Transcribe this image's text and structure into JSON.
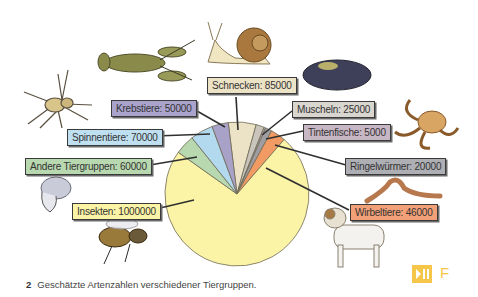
{
  "chart_data": {
    "type": "pie",
    "title": "",
    "center": [
      237,
      194
    ],
    "radius": 72,
    "start_angle_deg": -7,
    "slices": [
      {
        "name": "Schnecken",
        "value": 85000,
        "color": "#ece2c6"
      },
      {
        "name": "Muscheln",
        "value": 25000,
        "color": "#c9c4bc"
      },
      {
        "name": "Tintenfische",
        "value": 5000,
        "color": "#b8a6b4"
      },
      {
        "name": "Ringelwürmer",
        "value": 20000,
        "color": "#9e9ea2"
      },
      {
        "name": "Wirbeltiere",
        "value": 46000,
        "color": "#f19a63"
      },
      {
        "name": "Insekten",
        "value": 1000000,
        "color": "#fbf3a6"
      },
      {
        "name": "Andere Tiergruppen",
        "value": 60000,
        "color": "#b8d8b0"
      },
      {
        "name": "Spinnentiere",
        "value": 70000,
        "color": "#b3d9ee"
      },
      {
        "name": "Krebstiere",
        "value": 50000,
        "color": "#a8a2c8"
      }
    ]
  },
  "labels": {
    "schnecken": {
      "text": "Schnecken: 85000",
      "color": "#ece2c6"
    },
    "muscheln": {
      "text": "Muscheln: 25000",
      "color": "#d9d5cf"
    },
    "tintenfische": {
      "text": "Tintenfische: 5000",
      "color": "#c7b6c4"
    },
    "ringelwuermer": {
      "text": "Ringelwürmer: 20000",
      "color": "#aeafb4"
    },
    "wirbeltiere": {
      "text": "Wirbeltiere: 46000",
      "color": "#f2a077"
    },
    "insekten": {
      "text": "Insekten: 1000000",
      "color": "#fbf3a6"
    },
    "andere": {
      "text": "Andere Tiergruppen: 60000",
      "color": "#b8d8b0"
    },
    "spinnentiere": {
      "text": "Spinnentiere: 70000",
      "color": "#bfe0f0"
    },
    "krebstiere": {
      "text": "Krebstiere: 50000",
      "color": "#aaa4cc"
    }
  },
  "caption": {
    "number": "2",
    "text": "Geschätzte Artenzahlen verschiedener Tiergruppen."
  },
  "media_badge": {
    "icon": "play-pause-icon",
    "letter": "F",
    "color": "#f6c64a"
  }
}
